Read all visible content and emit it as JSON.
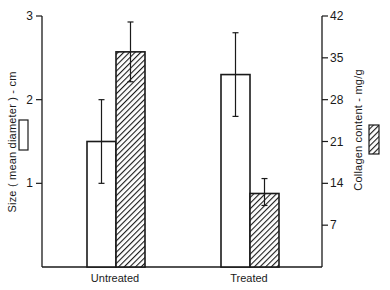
{
  "chart_data": {
    "type": "bar",
    "title": "",
    "categories": [
      "Untreated",
      "Treated"
    ],
    "xlabel": "",
    "ylabel": "Size ( mean diameter ) - cm",
    "ylabel_right": "Collagen content - mg/g",
    "ylim": [
      0,
      3
    ],
    "ylim_right": [
      0,
      42
    ],
    "yticks": [
      1,
      2,
      3
    ],
    "yticks_right": [
      7,
      14,
      21,
      28,
      35,
      42
    ],
    "grid": false,
    "legend_position": "inline with axis titles (open box = size, hatched box = collagen)",
    "series": [
      {
        "name": "Size (mean diameter) - cm",
        "axis": "left",
        "fill": "open",
        "values": [
          1.5,
          2.3
        ],
        "error_low": [
          1.0,
          1.8
        ],
        "error_high": [
          2.0,
          2.8
        ]
      },
      {
        "name": "Collagen content - mg/g",
        "axis": "right",
        "fill": "hatched",
        "values": [
          36,
          12.3
        ],
        "error_low": [
          31,
          10.3
        ],
        "error_high": [
          41,
          14.8
        ]
      }
    ]
  },
  "labels": {
    "left_axis_title": "Size ( mean diameter ) - cm",
    "right_axis_title": "Collagen content - mg/g",
    "left_ticks": [
      "1",
      "2",
      "3"
    ],
    "right_ticks": [
      "7",
      "14",
      "21",
      "28",
      "35",
      "42"
    ],
    "categories": [
      "Untreated",
      "Treated"
    ]
  },
  "colors": {
    "ink": "#1a1a1a",
    "background": "#ffffff"
  }
}
